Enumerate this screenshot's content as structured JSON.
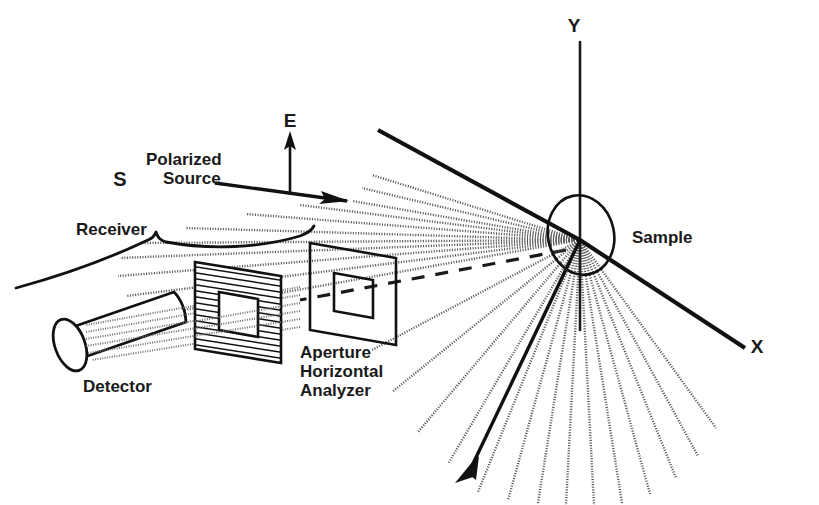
{
  "figure": {
    "background_color": "#ffffff",
    "line_color": "#111111",
    "ray_color": "#5a5a5a",
    "width": 819,
    "height": 505
  },
  "labels": {
    "y_axis": "Y",
    "x_axis": "X",
    "e_field": "E",
    "source_point": "S",
    "source_line1": "Polarized",
    "source_line2": "Source",
    "receiver": "Receiver",
    "detector": "Detector",
    "optics_line1": "Aperture",
    "optics_line2": "Horizontal",
    "optics_line3": "Analyzer",
    "sample": "Sample"
  },
  "geometry": {
    "sample_origin_x": 580,
    "sample_origin_y": 240,
    "sample_ellipse_rx": 33,
    "sample_ellipse_ry": 40,
    "sample_ellipse_rotation_deg": -12,
    "y_axis_top_y": 42,
    "y_axis_bottom_y": 330,
    "x_axis_end_x": 745,
    "x_axis_end_y": 348,
    "incident_beam_start_x": 378,
    "incident_beam_start_y": 130,
    "transmitted_arrow_end_x": 455,
    "transmitted_arrow_end_y": 483,
    "e_arrow_x": 290,
    "e_arrow_top_y": 133,
    "e_arrow_bottom_y": 192,
    "source_arrow_start_x": 215,
    "source_arrow_start_y": 183,
    "source_arrow_end_x": 347,
    "source_arrow_end_y": 200
  },
  "scattered_rays": {
    "count": 26,
    "description": "dotted rays radiating from the sample into the upper-left and lower half-plane",
    "upper_fan_angles_deg": [
      182,
      186,
      190,
      194,
      198,
      202,
      206,
      210
    ],
    "lower_fan_angles_deg": [
      214,
      222,
      230,
      238,
      246,
      254,
      262,
      270,
      278,
      286,
      294,
      302
    ],
    "style": "dotted"
  },
  "elements": {
    "detector_shape": "cylinder",
    "analyzer_shape": "hatched-parallelogram-with-window",
    "aperture_shape": "open-frame-parallelogram",
    "receiver_brace": "curly-bracket spanning detector through aperture"
  }
}
